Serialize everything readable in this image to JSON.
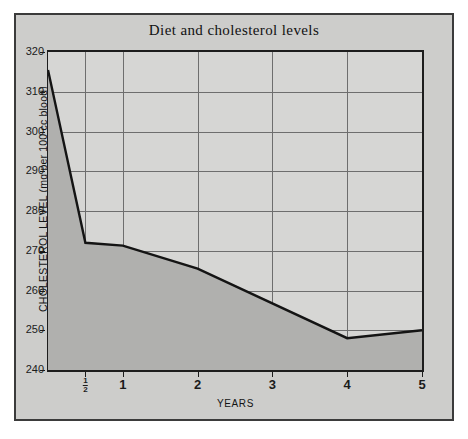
{
  "figure": {
    "title": "Diet and cholesterol levels",
    "panel_color": "#cdcdcb",
    "plot_color": "#d6d6d4",
    "fill_color": "#b0b0ae",
    "line_color": "#141414",
    "grid_color": "#6e6e6e"
  },
  "chart_data": {
    "type": "area",
    "title": "Diet and cholesterol levels",
    "xlabel": "YEARS",
    "ylabel": "CHOLESTEROL LEVEL (mg per 100 cc blood)",
    "xlim": [
      0,
      5
    ],
    "ylim": [
      240,
      320
    ],
    "grid": true,
    "legend": null,
    "x_tick_labels": [
      "0",
      "½",
      "1",
      "2",
      "3",
      "4",
      "5"
    ],
    "x_tick_values": [
      0,
      0.5,
      1,
      2,
      3,
      4,
      5
    ],
    "y_tick_labels": [
      "240",
      "250",
      "260",
      "270",
      "280",
      "290",
      "300",
      "310",
      "320"
    ],
    "y_tick_values": [
      240,
      250,
      260,
      270,
      280,
      290,
      300,
      310,
      320
    ],
    "series": [
      {
        "name": "Cholesterol level",
        "x": [
          0,
          0.5,
          1,
          2,
          4,
          5
        ],
        "values": [
          315.5,
          272.0,
          271.3,
          265.5,
          248.0,
          250.0
        ]
      }
    ]
  }
}
